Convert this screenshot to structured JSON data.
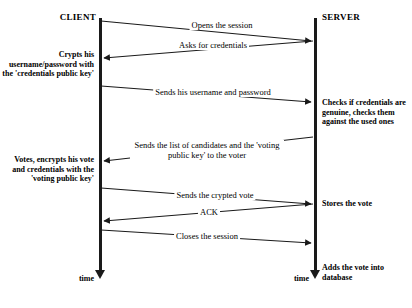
{
  "diagram": {
    "type": "sequence-diagram",
    "line_color": "#1a1a1a",
    "background": "#ffffff"
  },
  "actors": {
    "client": {
      "label": "CLIENT",
      "time_label": "time"
    },
    "server": {
      "label": "SERVER",
      "time_label": "time"
    }
  },
  "messages": [
    {
      "id": "open-session",
      "label": "Opens the session",
      "direction": "client-to-server"
    },
    {
      "id": "ask-credentials",
      "label": "Asks for credentials",
      "direction": "server-to-client"
    },
    {
      "id": "send-credentials",
      "label": "Sends his username and password",
      "direction": "client-to-server"
    },
    {
      "id": "send-candidates",
      "label": "Sends the list of candidates and the 'voting public key' to the voter",
      "direction": "server-to-client"
    },
    {
      "id": "send-vote",
      "label": "Sends the crypted vote",
      "direction": "client-to-server"
    },
    {
      "id": "ack",
      "label": "ACK",
      "direction": "server-to-client"
    },
    {
      "id": "close-session",
      "label": "Closes the session",
      "direction": "client-to-server"
    }
  ],
  "notes": {
    "client_crypts": "Crypts his username/password with the 'credentials public key'",
    "client_votes": "Votes, encrypts his vote and credentials with the 'voting public key'",
    "server_checks": "Checks if credentials are genuine, checks them against the used ones",
    "server_stores": "Stores the vote",
    "server_adds": "Adds the vote into database"
  }
}
